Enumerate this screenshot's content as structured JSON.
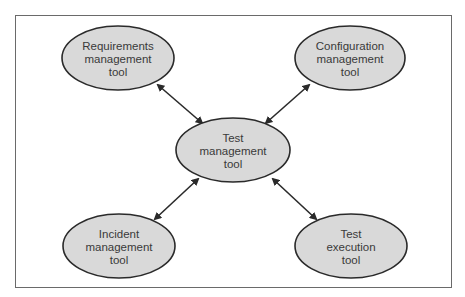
{
  "diagram": {
    "center": {
      "lines": [
        "Test",
        "management",
        "tool"
      ]
    },
    "nodes": [
      {
        "id": "requirements",
        "lines": [
          "Requirements",
          "management",
          "tool"
        ]
      },
      {
        "id": "configuration",
        "lines": [
          "Configuration",
          "management",
          "tool"
        ]
      },
      {
        "id": "incident",
        "lines": [
          "Incident",
          "management",
          "tool"
        ]
      },
      {
        "id": "execution",
        "lines": [
          "Test",
          "execution",
          "tool"
        ]
      }
    ],
    "edges": [
      {
        "from": "requirements",
        "to": "center",
        "type": "bidirectional"
      },
      {
        "from": "configuration",
        "to": "center",
        "type": "bidirectional"
      },
      {
        "from": "incident",
        "to": "center",
        "type": "bidirectional"
      },
      {
        "from": "execution",
        "to": "center",
        "type": "bidirectional"
      }
    ],
    "colors": {
      "node_fill": "#d9d9d9",
      "node_stroke": "#2a2a2a",
      "text": "#3a3a3a",
      "arrow": "#2a2a2a",
      "frame": "#6a6a6a"
    }
  }
}
